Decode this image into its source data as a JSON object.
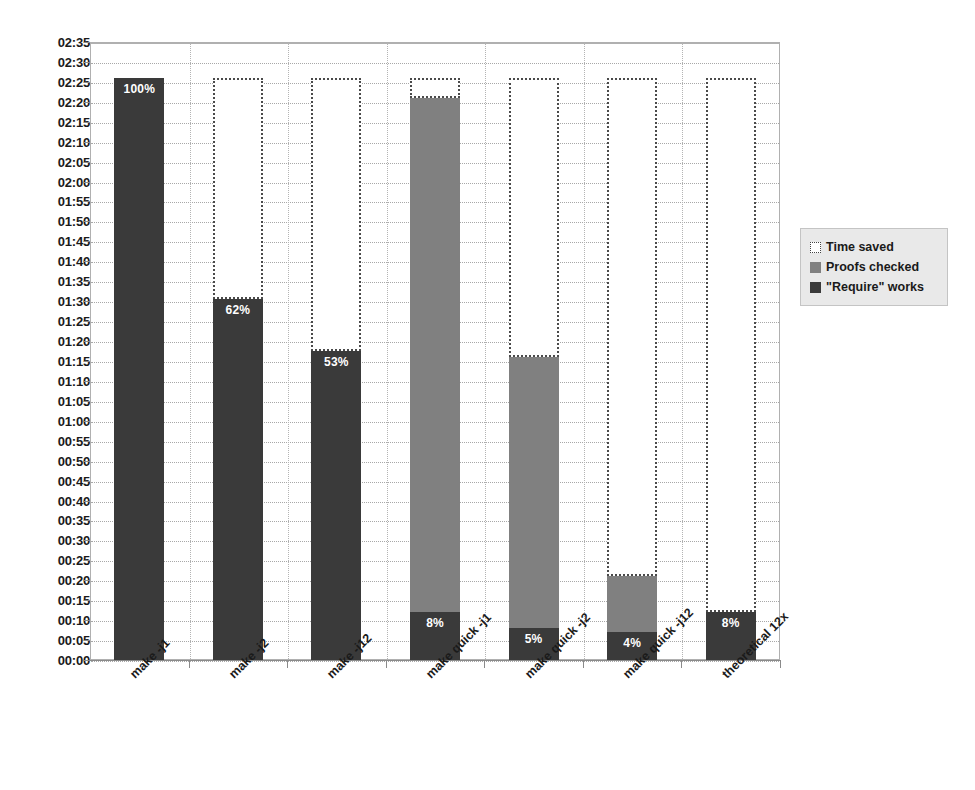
{
  "chart_data": {
    "type": "bar",
    "title": "",
    "subtitle": "",
    "xlabel": "",
    "ylabel": "",
    "stacked": true,
    "grid": true,
    "legend_position": "right",
    "ylim": [
      "00:00",
      "02:35"
    ],
    "ytick_interval_minutes": 5,
    "ytick_labels": [
      "02:35",
      "02:30",
      "02:25",
      "02:20",
      "02:15",
      "02:10",
      "02:05",
      "02:00",
      "01:55",
      "01:50",
      "01:45",
      "01:40",
      "01:35",
      "01:30",
      "01:25",
      "01:20",
      "01:15",
      "01:10",
      "01:05",
      "01:00",
      "00:55",
      "00:50",
      "00:45",
      "00:40",
      "00:35",
      "00:30",
      "00:25",
      "00:20",
      "00:15",
      "00:10",
      "00:05",
      "00:00"
    ],
    "categories": [
      "make -j1",
      "make -j2",
      "make -j12",
      "make quick -j1",
      "make quick -j2",
      "make quick -j12",
      "theoretical 12x"
    ],
    "series": [
      {
        "name": "\"Require\" works",
        "color": "#3a3a3a",
        "values_minutes": [
          146,
          90.5,
          77.5,
          12,
          8,
          7,
          12
        ],
        "values_time": [
          "02:26",
          "01:30",
          "01:17",
          "00:12",
          "00:08",
          "00:07",
          "00:12"
        ],
        "data_labels": [
          "100%",
          "62%",
          "53%",
          "8%",
          "5%",
          "4%",
          "8%"
        ]
      },
      {
        "name": "Proofs checked",
        "color": "#808080",
        "values_minutes": [
          0,
          0,
          0,
          129,
          68,
          14,
          0
        ],
        "values_time": [
          "00:00",
          "00:00",
          "00:00",
          "02:09",
          "01:08",
          "00:14",
          "00:00"
        ],
        "data_labels": [
          "",
          "",
          "",
          "",
          "",
          "",
          ""
        ]
      },
      {
        "name": "Time saved",
        "color": "#ffffff",
        "values_minutes": [
          0,
          55.5,
          68.5,
          5,
          70,
          125,
          134
        ],
        "values_time": [
          "00:00",
          "00:56",
          "01:09",
          "00:05",
          "01:10",
          "02:05",
          "02:14"
        ],
        "data_labels": [
          "",
          "",
          "",
          "",
          "",
          "",
          ""
        ]
      }
    ],
    "stack_tops_time": {
      "require_top": [
        "02:26",
        "01:30",
        "01:17",
        "00:12",
        "00:08",
        "00:07",
        "00:12"
      ],
      "proofs_top": [
        "02:26",
        "01:30",
        "01:17",
        "02:21",
        "01:16",
        "00:21",
        "00:12"
      ],
      "total_top": [
        "02:26",
        "02:26",
        "02:26",
        "02:26",
        "02:26",
        "02:26",
        "02:26"
      ]
    }
  },
  "legend": {
    "items": [
      {
        "label": "Time saved",
        "swatch": "dotted-outline-swatch"
      },
      {
        "label": "Proofs checked",
        "swatch": "gray-swatch"
      },
      {
        "label": "\"Require\" works",
        "swatch": "dark-gray-swatch"
      }
    ]
  },
  "colors": {
    "require_works": "#3a3a3a",
    "proofs_checked": "#808080",
    "time_saved_fill": "#ffffff",
    "time_saved_border": "#4a4a4a",
    "gridline": "#a8a8a8",
    "axis": "#8a8a8a",
    "legend_background": "#e9e9e9",
    "text": "#1a1a1a"
  }
}
